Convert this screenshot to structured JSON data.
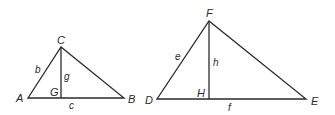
{
  "diagram": {
    "stroke_color": "#2a2a2a",
    "background": "#ffffff",
    "triangle_small": {
      "vertices": {
        "A": "A",
        "B": "B",
        "C": "C"
      },
      "foot": "G",
      "sides": {
        "AC": "b",
        "AB": "c",
        "altitude": "g"
      }
    },
    "triangle_large": {
      "vertices": {
        "D": "D",
        "E": "E",
        "F": "F"
      },
      "foot": "H",
      "sides": {
        "DF": "e",
        "DE": "f",
        "altitude": "h"
      }
    }
  }
}
